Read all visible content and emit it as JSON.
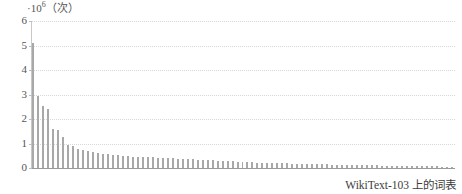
{
  "caption": "WikiText-103 上的词表",
  "axis": {
    "y_exponent_prefix": "·10",
    "y_exponent_power": "6",
    "y_unit": "（次）",
    "y_ticks": [
      "0",
      "1",
      "2",
      "3",
      "4",
      "5",
      "6"
    ]
  },
  "colors": {
    "bar": "#a8a8a8",
    "grid": "#d8d8d8",
    "axis": "#9a9a9a",
    "text": "#555555",
    "background": "#ffffff"
  },
  "chart_data": {
    "type": "bar",
    "title": "",
    "subtitle": "",
    "xlabel": "",
    "ylabel": "·10⁶（次）",
    "caption": "WikiText-103 上的词表",
    "grid": true,
    "legend": false,
    "ylim": [
      0,
      6
    ],
    "ytick_labels": [
      "0",
      "1",
      "2",
      "3",
      "4",
      "5",
      "6"
    ],
    "xtick_labels": [],
    "unit_scale": 1000000,
    "unit_name": "次",
    "categories": [
      1,
      2,
      3,
      4,
      5,
      6,
      7,
      8,
      9,
      10,
      11,
      12,
      13,
      14,
      15,
      16,
      17,
      18,
      19,
      20,
      21,
      22,
      23,
      24,
      25,
      26,
      27,
      28,
      29,
      30,
      31,
      32,
      33,
      34,
      35,
      36,
      37,
      38,
      39,
      40,
      41,
      42,
      43,
      44,
      45,
      46,
      47,
      48,
      49,
      50,
      51,
      52,
      53,
      54,
      55,
      56,
      57,
      58,
      59,
      60,
      61,
      62,
      63,
      64,
      65,
      66,
      67,
      68,
      69,
      70,
      71,
      72,
      73,
      74,
      75,
      76,
      77,
      78,
      79,
      80,
      81,
      82,
      83,
      84,
      85
    ],
    "values": [
      5.1,
      2.95,
      2.55,
      2.4,
      1.6,
      1.55,
      1.25,
      0.95,
      0.9,
      0.78,
      0.72,
      0.68,
      0.64,
      0.61,
      0.58,
      0.56,
      0.54,
      0.52,
      0.5,
      0.49,
      0.47,
      0.46,
      0.45,
      0.44,
      0.43,
      0.42,
      0.41,
      0.4,
      0.39,
      0.38,
      0.37,
      0.36,
      0.35,
      0.34,
      0.33,
      0.32,
      0.31,
      0.3,
      0.29,
      0.28,
      0.27,
      0.26,
      0.25,
      0.24,
      0.23,
      0.22,
      0.21,
      0.21,
      0.2,
      0.2,
      0.19,
      0.19,
      0.18,
      0.18,
      0.17,
      0.17,
      0.16,
      0.16,
      0.15,
      0.15,
      0.14,
      0.14,
      0.13,
      0.13,
      0.12,
      0.12,
      0.12,
      0.11,
      0.11,
      0.11,
      0.1,
      0.1,
      0.1,
      0.09,
      0.09,
      0.09,
      0.08,
      0.08,
      0.08,
      0.07,
      0.07,
      0.07,
      0.06,
      0.06,
      0.06
    ]
  }
}
